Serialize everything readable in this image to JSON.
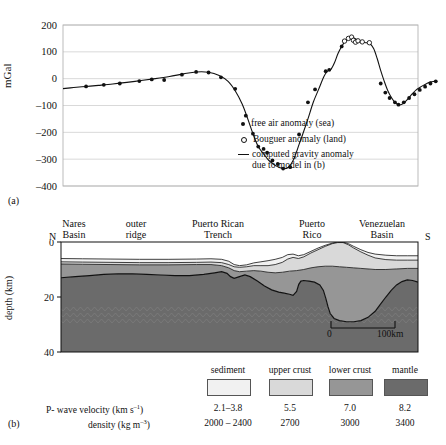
{
  "figure": {
    "panel_a_tag": "(a)",
    "panel_b_tag": "(b)"
  },
  "panel_a": {
    "ylabel": "mGal",
    "yticks": [
      "200",
      "100",
      "0",
      "–100",
      "–200",
      "–300",
      "–400"
    ],
    "legend": [
      {
        "marker": "filled-circle",
        "label": "free air anomaly (sea)"
      },
      {
        "marker": "open-circle",
        "label": "Bouguer anomaly (land)"
      },
      {
        "marker": "line",
        "label": "computed gravity anomaly"
      },
      {
        "marker": "none",
        "label": "due to model in (b)"
      }
    ]
  },
  "panel_b": {
    "ylabel": "depth (km)",
    "yticks": [
      "0",
      "20",
      "40"
    ],
    "end_label_left": "N",
    "end_label_right": "S",
    "features": [
      {
        "line1": "Nares",
        "line2": "Basin"
      },
      {
        "line1": "outer",
        "line2": "ridge"
      },
      {
        "line1": "Puerto Rican",
        "line2": "Trench"
      },
      {
        "line1": "Puerto",
        "line2": "Rico"
      },
      {
        "line1": "Venezuelan",
        "line2": "Basin"
      }
    ],
    "scalebar": {
      "left": "0",
      "right": "100km"
    }
  },
  "key": {
    "row_labels": [
      "P- wave velocity (km s–1)",
      "density (kg m–3)"
    ],
    "row_label_velocity_base": "P- wave velocity (km s",
    "row_label_velocity_sup": "–1",
    "row_label_density_base": "density (kg m",
    "row_label_density_sup": "–3",
    "columns": [
      {
        "name": "sediment",
        "color": "#f1f1f1",
        "velocity": "2.1–3.8",
        "density": "2000 – 2400"
      },
      {
        "name": "upper crust",
        "color": "#d9d9d9",
        "velocity": "5.5",
        "density": "2700"
      },
      {
        "name": "lower crust",
        "color": "#969696",
        "velocity": "7.0",
        "density": "3000"
      },
      {
        "name": "mantle",
        "color": "#6b6b6b",
        "velocity": "8.2",
        "density": "3400"
      }
    ]
  },
  "chart_data": {
    "type": "line",
    "xlabel": "",
    "ylabel": "mGal",
    "ylim": [
      -400,
      200
    ],
    "xlim": [
      0,
      100
    ],
    "grid": true,
    "legend_position": "inside-lower-right",
    "series": [
      {
        "name": "computed gravity anomaly due to model in (b)",
        "type": "line",
        "points": [
          [
            0.0,
            -37
          ],
          [
            3.0,
            -33
          ],
          [
            6.5,
            -29
          ],
          [
            10.0,
            -25
          ],
          [
            14.0,
            -20
          ],
          [
            18.0,
            -14
          ],
          [
            22.0,
            -7
          ],
          [
            26.0,
            0
          ],
          [
            30.0,
            8
          ],
          [
            34.0,
            18
          ],
          [
            37.5,
            25
          ],
          [
            41.0,
            24
          ],
          [
            44.0,
            12
          ],
          [
            46.5,
            -10
          ],
          [
            48.5,
            -45
          ],
          [
            50.5,
            -95
          ],
          [
            52.0,
            -148
          ],
          [
            53.5,
            -205
          ],
          [
            55.0,
            -253
          ],
          [
            56.5,
            -280
          ],
          [
            58.0,
            -305
          ],
          [
            60.0,
            -325
          ],
          [
            62.0,
            -335
          ],
          [
            63.5,
            -330
          ],
          [
            65.0,
            -300
          ],
          [
            66.5,
            -245
          ],
          [
            67.5,
            -208
          ],
          [
            69.0,
            -150
          ],
          [
            70.5,
            -88
          ],
          [
            72.0,
            -40
          ],
          [
            73.5,
            8
          ],
          [
            74.5,
            28
          ],
          [
            75.5,
            35
          ],
          [
            76.5,
            60
          ],
          [
            77.5,
            95
          ],
          [
            78.5,
            120
          ],
          [
            79.5,
            140
          ],
          [
            80.5,
            150
          ],
          [
            81.5,
            152
          ],
          [
            82.5,
            148
          ],
          [
            83.5,
            140
          ],
          [
            84.5,
            136
          ],
          [
            85.5,
            134
          ],
          [
            86.5,
            130
          ],
          [
            87.5,
            112
          ],
          [
            88.5,
            75
          ],
          [
            89.5,
            30
          ],
          [
            90.5,
            -10
          ],
          [
            91.5,
            -45
          ],
          [
            92.5,
            -70
          ],
          [
            93.5,
            -88
          ],
          [
            94.5,
            -97
          ],
          [
            95.5,
            -95
          ],
          [
            96.5,
            -85
          ],
          [
            97.5,
            -70
          ],
          [
            98.5,
            -55
          ],
          [
            99.5,
            -42
          ],
          [
            100.5,
            -33
          ],
          [
            101.5,
            -25
          ],
          [
            102.5,
            -18
          ],
          [
            103.5,
            -12
          ],
          [
            104.5,
            -10
          ]
        ]
      },
      {
        "name": "free air anomaly (sea)",
        "type": "scatter",
        "marker": "filled-circle",
        "points": [
          [
            6.5,
            -29
          ],
          [
            11.5,
            -23
          ],
          [
            16.0,
            -18
          ],
          [
            21.5,
            -9
          ],
          [
            25.0,
            -3
          ],
          [
            28.5,
            -5
          ],
          [
            33.5,
            15
          ],
          [
            37.5,
            25
          ],
          [
            41.0,
            23
          ],
          [
            44.5,
            5
          ],
          [
            48.5,
            -38
          ],
          [
            51.5,
            -138
          ],
          [
            53.5,
            -205
          ],
          [
            55.0,
            -253
          ],
          [
            56.5,
            -262
          ],
          [
            57.5,
            -276
          ],
          [
            59.0,
            -305
          ],
          [
            60.5,
            -318
          ],
          [
            62.0,
            -335
          ],
          [
            64.0,
            -330
          ],
          [
            66.5,
            -208
          ],
          [
            69.0,
            -88
          ],
          [
            71.0,
            -40
          ],
          [
            74.0,
            28
          ],
          [
            75.0,
            33
          ],
          [
            78.5,
            120
          ],
          [
            89.5,
            -18
          ],
          [
            90.8,
            -52
          ],
          [
            92.0,
            -72
          ],
          [
            93.5,
            -88
          ],
          [
            94.5,
            -97
          ],
          [
            96.0,
            -88
          ],
          [
            97.5,
            -72
          ],
          [
            99.0,
            -58
          ],
          [
            100.5,
            -42
          ],
          [
            102.0,
            -30
          ],
          [
            103.5,
            -18
          ],
          [
            105.0,
            -10
          ]
        ]
      },
      {
        "name": "Bouguer anomaly (land)",
        "type": "scatter",
        "marker": "open-circle",
        "points": [
          [
            79.3,
            140
          ],
          [
            80.4,
            150
          ],
          [
            81.3,
            155
          ],
          [
            81.8,
            143
          ],
          [
            82.4,
            136
          ],
          [
            83.1,
            141
          ],
          [
            84.3,
            137
          ],
          [
            86.3,
            134
          ]
        ]
      }
    ]
  }
}
